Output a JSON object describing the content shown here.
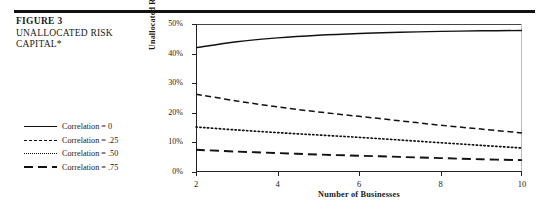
{
  "figure": {
    "number": "FIGURE 3",
    "title": "UNALLOCATED RISK CAPITAL*"
  },
  "legend": {
    "items": [
      {
        "label": "Correlation = 0",
        "style": "solid"
      },
      {
        "label": "Correlation = .25",
        "style": "dashed"
      },
      {
        "label": "Correlation = .50",
        "style": "dotted"
      },
      {
        "label": "Correlation = .75",
        "style": "long-dash"
      }
    ]
  },
  "chart_data": {
    "type": "line",
    "title": "",
    "xlabel": "Number of Businesses",
    "ylabel": "Unallocated Risk Capital",
    "xlim": [
      2,
      10
    ],
    "ylim": [
      0,
      0.5
    ],
    "grid": false,
    "legend_position": "left-outside",
    "xticks": [
      "2",
      "4",
      "6",
      "8",
      "10"
    ],
    "xtick_values": [
      2,
      4,
      6,
      8,
      10
    ],
    "yticks": [
      "0%",
      "10%",
      "20%",
      "30%",
      "40%",
      "50%"
    ],
    "ytick_values": [
      0,
      0.1,
      0.2,
      0.3,
      0.4,
      0.5
    ],
    "x": [
      2,
      3,
      4,
      5,
      6,
      7,
      8,
      9,
      10
    ],
    "series": [
      {
        "name": "Correlation = 0",
        "style": "solid",
        "values": [
          0.42,
          0.44,
          0.453,
          0.462,
          0.468,
          0.472,
          0.475,
          0.477,
          0.478
        ]
      },
      {
        "name": "Correlation = .25",
        "style": "dashed",
        "values": [
          0.263,
          0.24,
          0.22,
          0.203,
          0.188,
          0.173,
          0.158,
          0.145,
          0.132
        ]
      },
      {
        "name": "Correlation = .50",
        "style": "dotted",
        "values": [
          0.152,
          0.142,
          0.133,
          0.125,
          0.117,
          0.108,
          0.099,
          0.09,
          0.081
        ]
      },
      {
        "name": "Correlation = .75",
        "style": "long-dash",
        "values": [
          0.075,
          0.069,
          0.064,
          0.059,
          0.055,
          0.051,
          0.047,
          0.043,
          0.04
        ]
      }
    ]
  }
}
